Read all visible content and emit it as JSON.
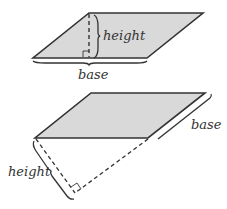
{
  "colors": {
    "fill": "#d9d9d9",
    "stroke": "#333333",
    "background": "#ffffff"
  },
  "figure_top": {
    "shape": "parallelogram",
    "vertices": [
      [
        89,
        13
      ],
      [
        203,
        13
      ],
      [
        147,
        58
      ],
      [
        33,
        58
      ]
    ],
    "height_label": "height",
    "base_label": "base",
    "height_line": {
      "from": [
        89,
        14
      ],
      "to": [
        89,
        57
      ],
      "style": "dashed"
    },
    "right_angle_marker": true
  },
  "figure_bottom": {
    "shape": "parallelogram",
    "vertices": [
      [
        91,
        93
      ],
      [
        205,
        93
      ],
      [
        148,
        138
      ],
      [
        35,
        138
      ]
    ],
    "height_label": "height",
    "base_label": "base",
    "height_line": {
      "from": [
        36,
        139
      ],
      "to": [
        75,
        193
      ],
      "style": "dashed"
    },
    "base_extension": {
      "from": [
        148,
        139
      ],
      "to": [
        75,
        193
      ],
      "style": "dashed"
    },
    "right_angle_marker": true
  }
}
